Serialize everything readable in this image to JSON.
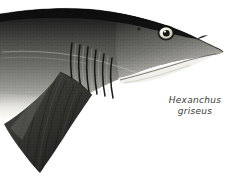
{
  "plate": {
    "subject": "bluntnose sixgill shark head and forebody",
    "orientation": "facing right",
    "background_color": "#ffffff",
    "width": 242,
    "height": 179
  },
  "caption": {
    "genus": "Hexanchus",
    "species": "griseus",
    "style": "italic",
    "color": "#3a3a3a"
  },
  "anatomy": {
    "gill_slit_count": 6,
    "eye_iris_color": "#efeae0",
    "eye_pupil_color": "#15130f",
    "dorsal_color": "#1b1b1b",
    "flank_color": "#7d7d78",
    "ventral_color": "#f2f1ec",
    "fin_color": "#3b3b38",
    "labels": {
      "eye": "eye",
      "snout": "snout",
      "nostril": "nostril",
      "mouth": "mouth-line",
      "gills": "gill-slits",
      "pectoral_fin": "pectoral-fin",
      "body": "body",
      "spiracle": "spiracle"
    }
  }
}
